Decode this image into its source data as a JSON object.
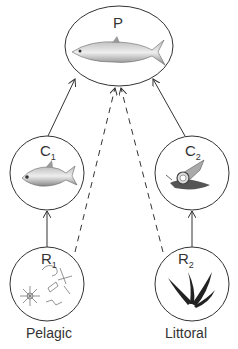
{
  "diagram": {
    "type": "food-web",
    "nodes": {
      "P": {
        "label": "P",
        "sub": "",
        "desc": "predator fish"
      },
      "C1": {
        "label": "C",
        "sub": "1",
        "desc": "pelagic consumer fish"
      },
      "C2": {
        "label": "C",
        "sub": "2",
        "desc": "littoral consumer snail"
      },
      "R1": {
        "label": "R",
        "sub": "1",
        "desc": "plankton resources"
      },
      "R2": {
        "label": "R",
        "sub": "2",
        "desc": "littoral plant resources"
      }
    },
    "habitats": {
      "left": "Pelagic",
      "right": "Littoral"
    },
    "edges": [
      {
        "from": "R1",
        "to": "C1",
        "style": "solid"
      },
      {
        "from": "R2",
        "to": "C2",
        "style": "solid"
      },
      {
        "from": "C1",
        "to": "P",
        "style": "solid"
      },
      {
        "from": "C2",
        "to": "P",
        "style": "solid"
      },
      {
        "from": "R1",
        "to": "P",
        "style": "dashed"
      },
      {
        "from": "R2",
        "to": "P",
        "style": "dashed"
      }
    ],
    "colors": {
      "line": "#333333",
      "text": "#333333"
    }
  }
}
